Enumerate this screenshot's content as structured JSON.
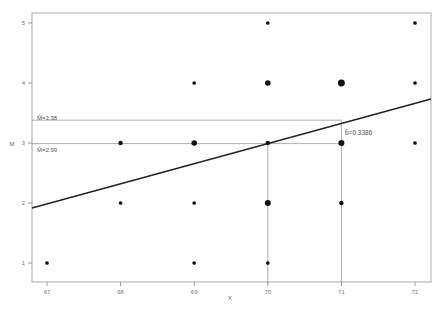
{
  "chart_data": {
    "type": "scatter",
    "title": "",
    "xlabel": "X",
    "ylabel": "M",
    "xlim": [
      66.8,
      72.2
    ],
    "ylim": [
      0.7,
      5.2
    ],
    "grid": false,
    "x_ticks": [
      67,
      68,
      69,
      70,
      71,
      72
    ],
    "y_ticks": [
      1,
      2,
      3,
      4,
      5
    ],
    "x_tick_labels": [
      "67",
      "68",
      "69",
      "70",
      "71",
      "72"
    ],
    "y_tick_labels": [
      "1",
      "2",
      "3",
      "4",
      "5"
    ],
    "points": [
      {
        "x": 67,
        "y": 1,
        "weight": 1
      },
      {
        "x": 68,
        "y": 3,
        "weight": 2
      },
      {
        "x": 68,
        "y": 2,
        "weight": 1
      },
      {
        "x": 69,
        "y": 4,
        "weight": 1
      },
      {
        "x": 69,
        "y": 3,
        "weight": 4
      },
      {
        "x": 69,
        "y": 2,
        "weight": 1
      },
      {
        "x": 69,
        "y": 1,
        "weight": 1
      },
      {
        "x": 70,
        "y": 5,
        "weight": 1
      },
      {
        "x": 70,
        "y": 4,
        "weight": 4
      },
      {
        "x": 70,
        "y": 3,
        "weight": 2
      },
      {
        "x": 70,
        "y": 2,
        "weight": 5
      },
      {
        "x": 70,
        "y": 1,
        "weight": 1
      },
      {
        "x": 71,
        "y": 4,
        "weight": 7
      },
      {
        "x": 71,
        "y": 3,
        "weight": 5
      },
      {
        "x": 71,
        "y": 2,
        "weight": 2
      },
      {
        "x": 72,
        "y": 5,
        "weight": 1
      },
      {
        "x": 72,
        "y": 4,
        "weight": 1
      },
      {
        "x": 72,
        "y": 3,
        "weight": 1
      }
    ],
    "regression_line": {
      "slope": 0.3386,
      "x0": 66.8,
      "y0": 1.92,
      "x1": 72.2,
      "y1": 3.73
    },
    "annotations": [
      {
        "text": "M̂=3.38",
        "x": 67,
        "y": 3.38,
        "line_to_x": 71
      },
      {
        "text": "M̂=2.99",
        "x": 67,
        "y": 2.99,
        "line_to_x": 70
      },
      {
        "text": "b̂=0.3386",
        "x": 71,
        "y": 3.38
      }
    ],
    "reference_lines": [
      {
        "type": "horizontal",
        "y": 3.38,
        "x_from": 66.8,
        "x_to": 71
      },
      {
        "type": "horizontal",
        "y": 2.99,
        "x_from": 66.8,
        "x_to": 71
      },
      {
        "type": "vertical",
        "x": 70,
        "y_from": 0.7,
        "y_to": 2.99
      },
      {
        "type": "vertical",
        "x": 71,
        "y_from": 0.7,
        "y_to": 3.38
      }
    ]
  },
  "labels": {
    "xlabel": "X",
    "ylabel": "M",
    "mean_high": "M̂=3.38",
    "mean_low": "M̂=2.99",
    "slope": "b̂=0.3386"
  }
}
